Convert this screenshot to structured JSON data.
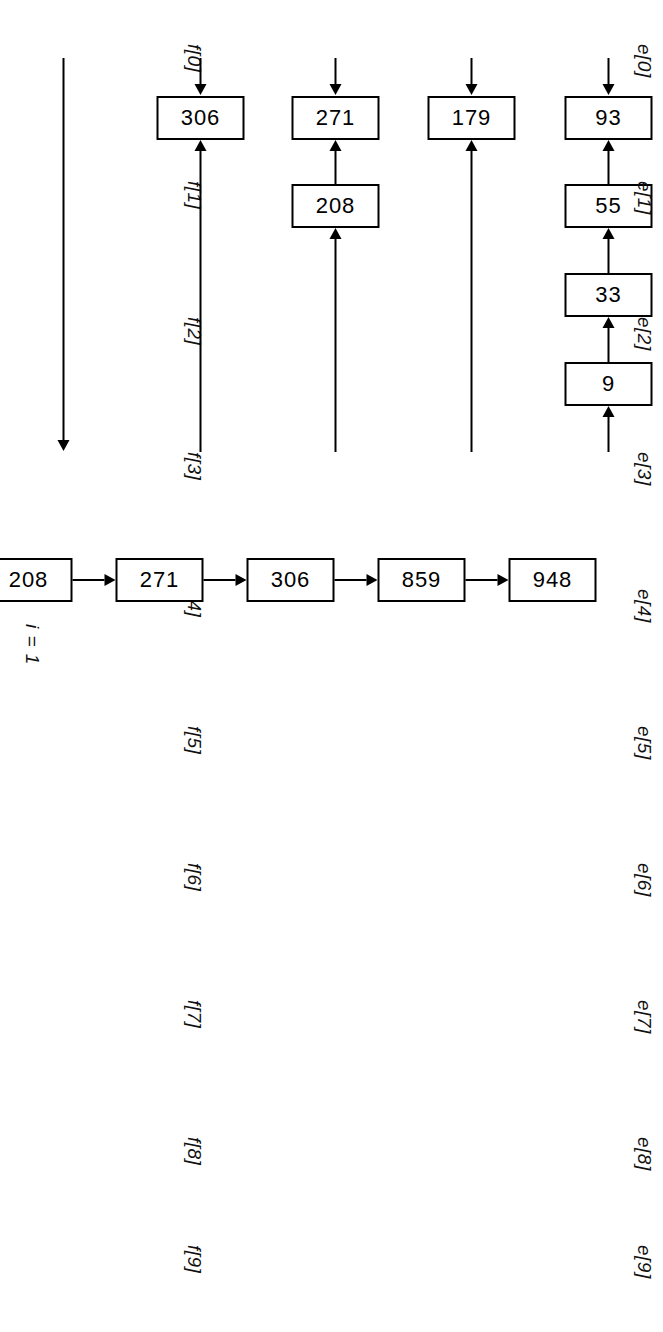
{
  "figure": {
    "caption_label": "i = 1",
    "row_labels": {
      "left_prefix": "e",
      "right_prefix": "f"
    },
    "rows": [
      {
        "e_label": "e[0]",
        "f_label": "f[0]",
        "boxes": [
          "93",
          "55",
          "33",
          "9"
        ],
        "direction": "right-to-left"
      },
      {
        "e_label": "e[1]",
        "f_label": "f[1]",
        "boxes": [
          "179"
        ],
        "direction": "right-to-left"
      },
      {
        "e_label": "e[2]",
        "f_label": "f[2]",
        "boxes": [
          "271",
          "208"
        ],
        "direction": "right-to-left"
      },
      {
        "e_label": "e[3]",
        "f_label": "f[3]",
        "boxes": [
          "306"
        ],
        "direction": "right-to-left"
      },
      {
        "e_label": "e[4]",
        "f_label": "f[4]",
        "boxes": [],
        "direction": "empty"
      },
      {
        "e_label": "e[5]",
        "f_label": "f[5]",
        "boxes": [],
        "direction": "empty"
      },
      {
        "e_label": "e[6]",
        "f_label": "f[6]",
        "boxes": [],
        "direction": "empty"
      },
      {
        "e_label": "e[7]",
        "f_label": "f[7]",
        "boxes": [],
        "direction": "empty"
      },
      {
        "e_label": "e[8]",
        "f_label": "f[8]",
        "boxes": [
          "859"
        ],
        "direction": "right-to-left"
      },
      {
        "e_label": "e[9]",
        "f_label": "f[9]",
        "boxes": [
          "984"
        ],
        "direction": "right-to-left"
      }
    ],
    "merged_chain": {
      "label": "i = 1",
      "nodes": [
        "9",
        "33",
        "55",
        "93",
        "179",
        "208",
        "271",
        "306",
        "859",
        "948"
      ]
    },
    "colors": {
      "ink": "#000000",
      "paper": "#ffffff"
    }
  }
}
